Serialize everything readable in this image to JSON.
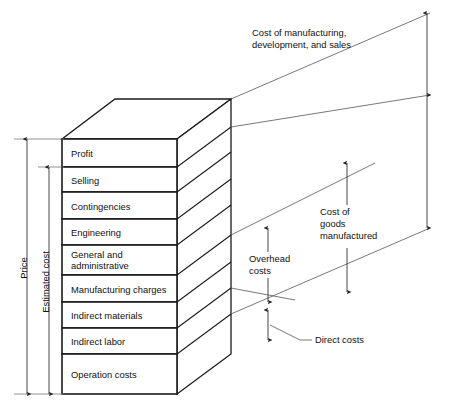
{
  "diagram": {
    "type": "stacked-block-cost-diagram",
    "colors": {
      "outline": "#1a1a1a",
      "dimension": "#333333",
      "leader": "#555555",
      "background": "#ffffff",
      "text": "#111111"
    },
    "stack": {
      "name": "cost-stack",
      "layers": [
        {
          "id": "profit",
          "label": "Profit"
        },
        {
          "id": "selling",
          "label": "Selling"
        },
        {
          "id": "contingencies",
          "label": "Contingencies"
        },
        {
          "id": "engineering",
          "label": "Engineering"
        },
        {
          "id": "general-administrative",
          "label": "General and",
          "label2": "administrative"
        },
        {
          "id": "manufacturing-charges",
          "label": "Manufacturing charges"
        },
        {
          "id": "indirect-materials",
          "label": "Indirect materials"
        },
        {
          "id": "indirect-labor",
          "label": "Indirect labor"
        },
        {
          "id": "operation-costs",
          "label": "Operation costs"
        }
      ]
    },
    "left_dimensions": [
      {
        "id": "price",
        "label": "Price"
      },
      {
        "id": "estimated-cost",
        "label": "Estimated cost"
      }
    ],
    "right_callouts": [
      {
        "id": "cost-of-manufacturing",
        "line1": "Cost of manufacturing,",
        "line2": "development, and sales"
      },
      {
        "id": "cost-of-goods-manufactured",
        "line1": "Cost of",
        "line2": "goods",
        "line3": "manufactured"
      },
      {
        "id": "overhead-costs",
        "line1": "Overhead",
        "line2": "costs"
      },
      {
        "id": "direct-costs",
        "line1": "Direct costs"
      }
    ]
  }
}
